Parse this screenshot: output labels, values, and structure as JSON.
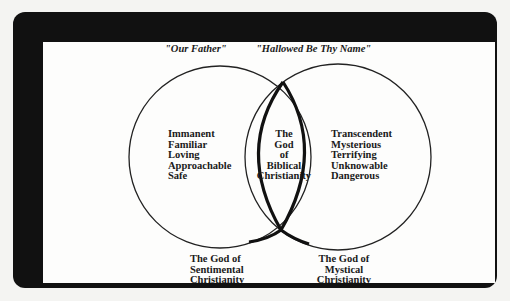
{
  "diagram": {
    "type": "venn",
    "headings": {
      "left": "\"Our Father\"",
      "right": "\"Hallowed Be Thy Name\""
    },
    "left_circle": {
      "attributes": [
        "Immanent",
        "Familiar",
        "Loving",
        "Approachable",
        "Safe"
      ],
      "caption": [
        "The God of",
        "Sentimental",
        "Christianity"
      ]
    },
    "intersection": {
      "label": [
        "The",
        "God",
        "of",
        "Biblical",
        "Christianity"
      ],
      "shape": "ichthys-fish-outline"
    },
    "right_circle": {
      "attributes": [
        "Transcendent",
        "Mysterious",
        "Terrifying",
        "Unknowable",
        "Dangerous"
      ],
      "caption": [
        "The God of",
        "Mystical",
        "Christianity"
      ]
    },
    "colors": {
      "frame": "#111111",
      "background": "#fdfdfc",
      "ink": "#1a1a1a"
    }
  }
}
